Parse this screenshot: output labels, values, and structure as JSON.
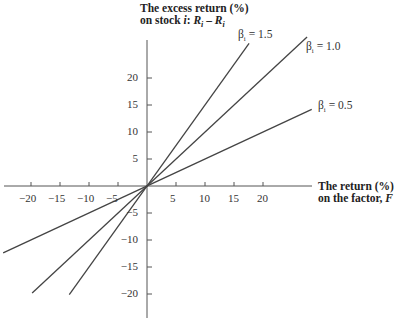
{
  "chart_data": {
    "type": "line",
    "title": "",
    "ylabel_line1": "The excess return (%)",
    "ylabel_line2": "on stock i: R_i − R_f",
    "xlabel_line1": "The return (%)",
    "xlabel_line2": "on the factor, F",
    "xticks": [
      -20,
      -15,
      -10,
      -5,
      5,
      10,
      15,
      20
    ],
    "yticks": [
      20,
      15,
      10,
      5,
      -5,
      -10,
      -15,
      -20
    ],
    "xlim": [
      -25,
      27
    ],
    "ylim": [
      -23,
      27
    ],
    "grid": false,
    "series": [
      {
        "name": "β_i = 1.5",
        "label": "βi = 1.5",
        "beta": 1.5,
        "x": [
          -13.4,
          17.6
        ],
        "y": [
          -20.1,
          26.4
        ]
      },
      {
        "name": "β_i = 1.0",
        "label": "βi = 1.0",
        "beta": 1.0,
        "x": [
          -19.8,
          27.6
        ],
        "y": [
          -19.8,
          27.6
        ]
      },
      {
        "name": "β_i = 0.5",
        "label": "βi = 0.5",
        "beta": 0.5,
        "x": [
          -24.8,
          28.4
        ],
        "y": [
          -12.4,
          14.2
        ]
      }
    ]
  },
  "labels": {
    "y_title_1": "The excess return (%)",
    "y_title_2_prefix": "on stock ",
    "y_title_2_var": "i",
    "y_title_2_suffix": ": ",
    "y_title_formula": "R",
    "y_title_sub1": "i",
    "y_title_minus": " – ",
    "y_title_sub2": "i",
    "x_title_1": "The return (%)",
    "x_title_2_prefix": "on the factor, ",
    "x_title_2_var": "F",
    "beta_15": "= 1.5",
    "beta_10": "= 1.0",
    "beta_05": "= 0.5",
    "beta_symbol": "β",
    "beta_sub": "i",
    "xt": [
      "−20",
      "−15",
      "−10",
      "−5",
      "5",
      "10",
      "15",
      "20"
    ],
    "yt": [
      "20",
      "15",
      "10",
      "5",
      "−5",
      "−10",
      "−15",
      "−20"
    ]
  }
}
